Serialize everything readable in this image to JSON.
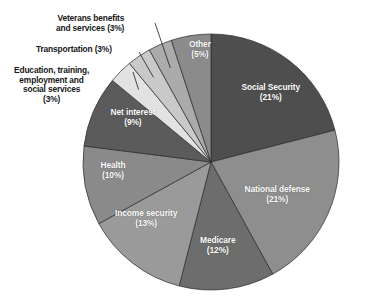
{
  "chart_data": {
    "type": "pie",
    "title": "",
    "subtitle": "",
    "xlabel": "",
    "ylabel": "",
    "legend_position": "none",
    "grid": false,
    "units": "percent",
    "start_angle_deg": 0,
    "direction": "clockwise",
    "categories": [
      "Social Security",
      "National defense",
      "Medicare",
      "Income security",
      "Health",
      "Net interest",
      "Education, training, employment and social services",
      "Transportation",
      "Veterans benefits and services",
      "Other"
    ],
    "values": [
      21,
      21,
      12,
      13,
      10,
      9,
      3,
      3,
      3,
      5
    ],
    "colors": [
      "#4e4e4e",
      "#8e8e8e",
      "#6d6d6d",
      "#9a9a9a",
      "#8a8a8a",
      "#5b5b5b",
      "#e2e2e2",
      "#c9c9c9",
      "#ababab",
      "#8b8b8b"
    ],
    "slices": [
      {
        "name": "Social Security",
        "label": "Social Security\n(21%)",
        "value": 21,
        "color": "#4e4e4e",
        "label_placement": "inside",
        "label_x": 271,
        "label_y": 93
      },
      {
        "name": "National defense",
        "label": "National defense\n(21%)",
        "value": 21,
        "color": "#8e8e8e",
        "label_placement": "inside",
        "label_x": 277,
        "label_y": 195
      },
      {
        "name": "Medicare",
        "label": "Medicare\n(12%)",
        "value": 12,
        "color": "#6d6d6d",
        "label_placement": "inside",
        "label_x": 218,
        "label_y": 246
      },
      {
        "name": "Income security",
        "label": "Income security\n(13%)",
        "value": 13,
        "color": "#9a9a9a",
        "label_placement": "inside",
        "label_x": 146,
        "label_y": 219
      },
      {
        "name": "Health",
        "label": "Health\n(10%)",
        "value": 10,
        "color": "#8a8a8a",
        "label_placement": "inside",
        "label_x": 113,
        "label_y": 171
      },
      {
        "name": "Net interest",
        "label": "Net interest\n(9%)",
        "value": 9,
        "color": "#5b5b5b",
        "label_placement": "inside",
        "label_x": 133,
        "label_y": 118
      },
      {
        "name": "Education, training, employment and social services",
        "label": "Education, training,\nemployment and\nsocial services\n(3%)",
        "value": 3,
        "color": "#e2e2e2",
        "label_placement": "outside",
        "label_x": 14,
        "label_y": 66
      },
      {
        "name": "Transportation",
        "label": "Transportation (3%)",
        "value": 3,
        "color": "#c9c9c9",
        "label_placement": "outside",
        "label_x": 36,
        "label_y": 45
      },
      {
        "name": "Veterans benefits and services",
        "label": "Veterans benefits\nand services (3%)",
        "value": 3,
        "color": "#ababab",
        "label_placement": "outside",
        "label_x": 56,
        "label_y": 14
      },
      {
        "name": "Other",
        "label": "Other\n(5%)",
        "value": 5,
        "color": "#8b8b8b",
        "label_placement": "inside",
        "label_x": 200,
        "label_y": 50
      }
    ]
  },
  "labels": {
    "social_security": "Social Security\n(21%)",
    "national_defense": "National defense\n(21%)",
    "medicare": "Medicare\n(12%)",
    "income_security": "Income security\n(13%)",
    "health": "Health\n(10%)",
    "net_interest": "Net interest\n(9%)",
    "education": "Education, training,\nemployment and\nsocial services\n(3%)",
    "transportation": "Transportation (3%)",
    "veterans": "Veterans benefits\nand services (3%)",
    "other": "Other\n(5%)"
  }
}
